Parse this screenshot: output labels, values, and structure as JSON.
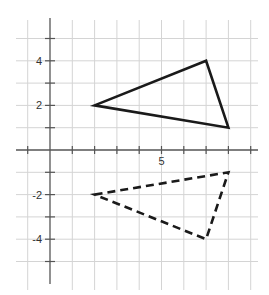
{
  "chart_data": {
    "type": "diagram",
    "title": "",
    "axes": {
      "x_range": [
        -1,
        9
      ],
      "y_range": [
        -5,
        5
      ],
      "grid": true,
      "grid_spacing": 1,
      "x_tick_labels": [
        {
          "value": 5,
          "label": "5"
        }
      ],
      "y_tick_labels": [
        {
          "value": 4,
          "label": "4"
        },
        {
          "value": 2,
          "label": "2"
        },
        {
          "value": -2,
          "label": "-2"
        },
        {
          "value": -4,
          "label": "-4"
        }
      ]
    },
    "shapes": [
      {
        "name": "original-triangle",
        "style": "solid",
        "vertices": [
          [
            2,
            2
          ],
          [
            7,
            4
          ],
          [
            8,
            1
          ]
        ]
      },
      {
        "name": "reflected-triangle",
        "style": "dashed",
        "vertices": [
          [
            2,
            -2
          ],
          [
            8,
            -1
          ],
          [
            7,
            -4
          ]
        ]
      }
    ]
  },
  "style": {
    "grid_color": "#d4d4d4",
    "axis_color": "#555555",
    "shape_color": "#1a1a1a"
  }
}
